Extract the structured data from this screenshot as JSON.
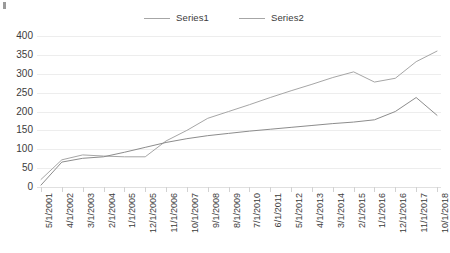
{
  "chart_data": {
    "type": "line",
    "title": "",
    "xlabel": "",
    "ylabel": "",
    "ylim": [
      0,
      400
    ],
    "ytick_step": 50,
    "yticks": [
      "0",
      "50",
      "100",
      "150",
      "200",
      "250",
      "300",
      "350",
      "400"
    ],
    "grid": true,
    "legend_position": "top-center",
    "categories": [
      "5/1/2001",
      "4/1/2002",
      "3/1/2003",
      "2/1/2004",
      "1/1/2005",
      "12/1/2005",
      "11/1/2006",
      "10/1/2007",
      "9/1/2008",
      "8/1/2009",
      "7/1/2010",
      "6/1/2011",
      "5/1/2012",
      "4/1/2013",
      "3/1/2014",
      "2/1/2015",
      "1/1/2016",
      "12/1/2016",
      "11/1/2017",
      "10/1/2018"
    ],
    "series": [
      {
        "name": "Series1",
        "color": "#a6a6a6",
        "values": [
          20,
          72,
          85,
          82,
          80,
          80,
          122,
          150,
          182,
          200,
          218,
          237,
          255,
          272,
          290,
          305,
          278,
          288,
          332,
          360
        ]
      },
      {
        "name": "Series2",
        "color": "#8c8c8c",
        "values": [
          5,
          66,
          76,
          80,
          92,
          105,
          118,
          128,
          136,
          142,
          148,
          153,
          158,
          163,
          168,
          172,
          178,
          200,
          237,
          190
        ]
      }
    ],
    "series2_overlay_note": "",
    "legend": [
      "Series1",
      "Series2"
    ]
  },
  "colors": {
    "grid": "#ededed",
    "axis": "#e0e0e0",
    "text": "#3b3b3b",
    "series1": "#a6a6a6",
    "series2": "#8c8c8c",
    "background": "#ffffff"
  }
}
